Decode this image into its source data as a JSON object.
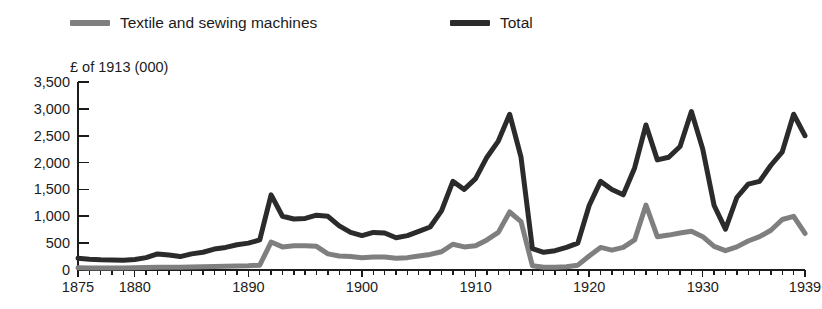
{
  "chart_data": {
    "type": "line",
    "title": "",
    "subtitle": "",
    "xlabel": "",
    "ylabel": "£ of 1913 (000)",
    "unit_note": "£ of 1913 (000)",
    "grid": false,
    "legend_position": "top",
    "xlim": [
      1875,
      1939
    ],
    "ylim": [
      0,
      3500
    ],
    "ytick_values": [
      3500,
      3000,
      2500,
      2000,
      1500,
      1000,
      500,
      0
    ],
    "ytick_labels": [
      "3,500",
      "3,000",
      "2,500",
      "2,000",
      "1,500",
      "1,000",
      "500",
      "0"
    ],
    "xtick_values": [
      1875,
      1880,
      1890,
      1900,
      1910,
      1920,
      1930,
      1939
    ],
    "xtick_labels": [
      "1875",
      "1880",
      "1890",
      "1900",
      "1910",
      "1920",
      "1930",
      "1939"
    ],
    "x": [
      1875,
      1876,
      1877,
      1878,
      1879,
      1880,
      1881,
      1882,
      1883,
      1884,
      1885,
      1886,
      1887,
      1888,
      1889,
      1890,
      1891,
      1892,
      1893,
      1894,
      1895,
      1896,
      1897,
      1898,
      1899,
      1900,
      1901,
      1902,
      1903,
      1904,
      1905,
      1906,
      1907,
      1908,
      1909,
      1910,
      1911,
      1912,
      1913,
      1914,
      1915,
      1916,
      1917,
      1918,
      1919,
      1920,
      1921,
      1922,
      1923,
      1924,
      1925,
      1926,
      1927,
      1928,
      1929,
      1930,
      1931,
      1932,
      1933,
      1934,
      1935,
      1936,
      1937,
      1938,
      1939
    ],
    "series": [
      {
        "name": "Total",
        "color": "#2b2b2b",
        "linewidth": 5,
        "values": [
          220,
          200,
          190,
          185,
          180,
          195,
          230,
          300,
          280,
          250,
          300,
          330,
          390,
          420,
          470,
          500,
          560,
          1400,
          1000,
          950,
          960,
          1020,
          1000,
          820,
          700,
          640,
          700,
          690,
          600,
          640,
          720,
          800,
          1100,
          1650,
          1500,
          1700,
          2100,
          2400,
          2900,
          2100,
          400,
          330,
          360,
          420,
          500,
          1200,
          1650,
          1500,
          1400,
          1900,
          2700,
          2050,
          2100,
          2300,
          2950,
          2250,
          1200,
          760,
          1350,
          1600,
          1650,
          1950,
          2200,
          2900,
          2500
        ]
      },
      {
        "name": "Textile and sewing machines",
        "color": "#7f7f7f",
        "linewidth": 5,
        "values": [
          40,
          35,
          35,
          35,
          35,
          40,
          45,
          50,
          50,
          50,
          55,
          60,
          65,
          70,
          75,
          80,
          90,
          520,
          430,
          450,
          450,
          440,
          300,
          260,
          250,
          230,
          240,
          240,
          220,
          230,
          260,
          290,
          340,
          480,
          430,
          450,
          560,
          700,
          1080,
          900,
          80,
          50,
          50,
          60,
          90,
          260,
          420,
          370,
          420,
          560,
          1210,
          620,
          650,
          690,
          720,
          620,
          440,
          360,
          430,
          540,
          620,
          740,
          940,
          1000,
          680
        ]
      }
    ]
  },
  "legend": {
    "entries": [
      {
        "label": "Textile and sewing machines",
        "color": "#7f7f7f"
      },
      {
        "label": "Total",
        "color": "#2b2b2b"
      }
    ]
  },
  "axis_unit_label": "£ of 1913 (000)"
}
